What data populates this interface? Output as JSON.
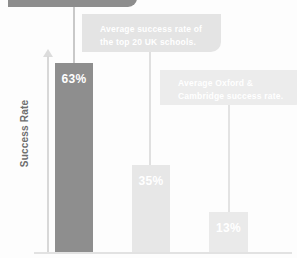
{
  "chart_data": {
    "type": "bar",
    "title": "",
    "xlabel": "",
    "ylabel": "Success Rate",
    "categories": [
      "",
      "",
      ""
    ],
    "values": [
      63,
      35,
      13
    ],
    "value_labels": [
      "63%",
      "35%",
      "13%"
    ],
    "ylim": [
      0,
      70
    ],
    "grid": false,
    "legend": "none",
    "series": [
      {
        "name": "Success rate",
        "values": [
          63,
          35,
          13
        ]
      }
    ],
    "annotations": [
      {
        "id": "callout-top",
        "lines": [],
        "text": "",
        "target_bar": 0,
        "note": "dark rounded banner cropped off at top of image, no legible text"
      },
      {
        "id": "callout-top20",
        "lines": [
          "Average success rate of",
          "the top 20 UK schools."
        ],
        "text": "Average success rate of the top 20 UK schools.",
        "target_bar": 1
      },
      {
        "id": "callout-oxbridge",
        "lines": [
          "Average Oxford &",
          "Cambridge success rate."
        ],
        "text": "Average Oxford & Cambridge success rate.",
        "target_bar": 2
      }
    ],
    "colors": {
      "bar_primary": "#8e8e8e",
      "bar_secondary": "#e7e7e7",
      "bar_tertiary": "#eaeaea",
      "callout_dark": "#8d8d8d",
      "callout_light": "#e4e4e4",
      "callout_lighter": "#ececec",
      "axis": "#d8d8d8",
      "axis_label": "#6e6e6e",
      "value_label": "#ffffff",
      "background": "#fdfdfd"
    }
  },
  "axis": {
    "y_title": "Success Rate"
  },
  "bars": [
    {
      "value_label": "63%"
    },
    {
      "value_label": "35%"
    },
    {
      "value_label": "13%"
    }
  ],
  "callouts": [
    {
      "line1": "",
      "line2": ""
    },
    {
      "line1": "Average success rate of",
      "line2": "the top 20 UK schools."
    },
    {
      "line1": "Average Oxford &",
      "line2": "Cambridge success rate."
    }
  ]
}
